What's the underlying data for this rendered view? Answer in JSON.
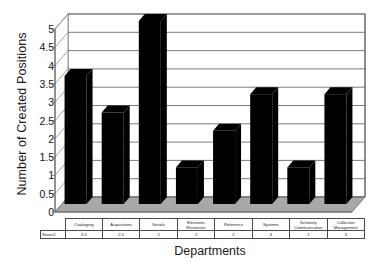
{
  "chart_data": {
    "type": "bar",
    "title": "",
    "xlabel": "Departments",
    "ylabel": "Number of Created Positions",
    "categories": [
      "Cataloging",
      "Acquisitions",
      "Serials",
      "Electronic Resources",
      "Reference",
      "Systems",
      "Scholarly Communication",
      "Collection Management"
    ],
    "values": [
      3.5,
      2.5,
      5,
      1,
      2,
      3,
      1,
      3
    ],
    "series": [
      {
        "name": "Series1",
        "values": [
          3.5,
          2.5,
          5,
          1,
          2,
          3,
          1,
          3
        ]
      }
    ],
    "ylim": [
      0,
      5
    ],
    "ytick_labels": [
      "5",
      "4.5",
      "4",
      "3.5",
      "3",
      "2.5",
      "2",
      "1.5",
      "1",
      "0.5",
      "0"
    ],
    "ytick_values": [
      5,
      4.5,
      4,
      3.5,
      3,
      2.5,
      2,
      1.5,
      1,
      0.5,
      0
    ],
    "grid": true,
    "legend": "none",
    "style": "3d-column",
    "bar_color": "#000000",
    "floor_color": "#a8a8a8",
    "wall_color": "#ffffff",
    "grid_color": "#5a5a5a"
  },
  "axis": {
    "y_title": "Number of Created Positions",
    "x_title": "Departments"
  },
  "data_table": {
    "series_label": "Series1",
    "headers": [
      {
        "line1": "Cataloging",
        "line2": ""
      },
      {
        "line1": "Acquisitions",
        "line2": ""
      },
      {
        "line1": "Serials",
        "line2": ""
      },
      {
        "line1": "Electronic",
        "line2": "Resources"
      },
      {
        "line1": "Reference",
        "line2": ""
      },
      {
        "line1": "Systems",
        "line2": ""
      },
      {
        "line1": "Scholarly",
        "line2": "Communication"
      },
      {
        "line1": "Collection",
        "line2": "Management"
      }
    ],
    "values": [
      "3.5",
      "2.5",
      "5",
      "1",
      "2",
      "3",
      "1",
      "3"
    ]
  }
}
